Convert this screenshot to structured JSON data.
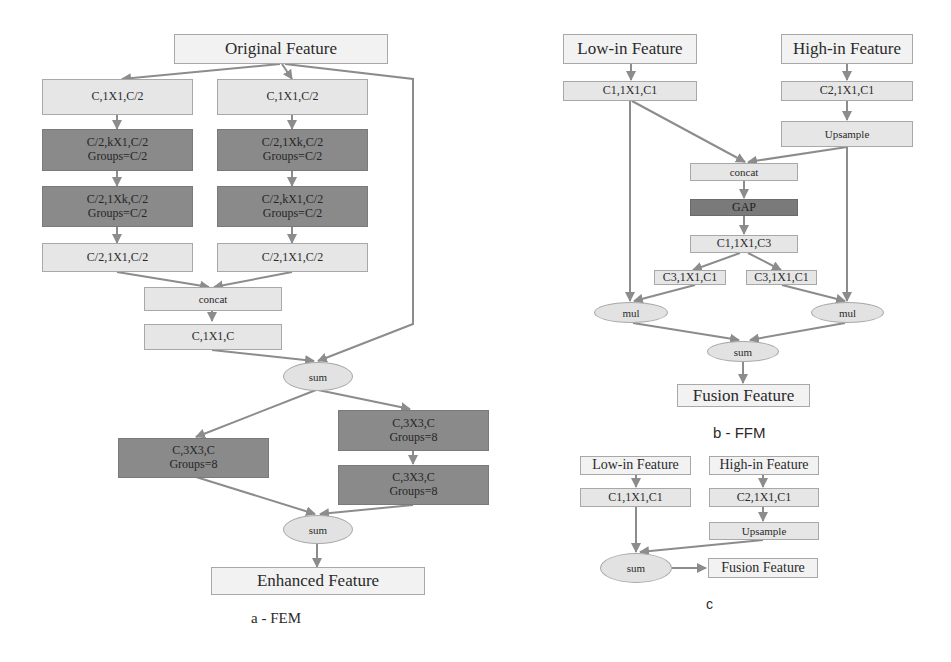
{
  "figure_a": {
    "caption": "a - FEM",
    "input": "Original Feature",
    "left_branch": [
      "C,1X1,C/2",
      "C/2,kX1,C/2",
      "Groups=C/2",
      "C/2,1Xk,C/2",
      "Groups=C/2",
      "C/2,1X1,C/2"
    ],
    "right_branch": [
      "C,1X1,C/2",
      "C/2,1Xk,C/2",
      "Groups=C/2",
      "C/2,kX1,C/2",
      "Groups=C/2",
      "C/2,1X1,C/2"
    ],
    "concat": "concat",
    "merge_conv": "C,1X1,C",
    "sum1": "sum",
    "left_dilated": [
      "C,3X3,C",
      "Groups=8"
    ],
    "right_dilated_1": [
      "C,3X3,C",
      "Groups=8"
    ],
    "right_dilated_2": [
      "C,3X3,C",
      "Groups=8"
    ],
    "sum2": "sum",
    "output": "Enhanced Feature"
  },
  "figure_b": {
    "caption": "b - FFM",
    "low_input": "Low-in Feature",
    "high_input": "High-in Feature",
    "low_conv": "C1,1X1,C1",
    "high_conv": "C2,1X1,C1",
    "upsample": "Upsample",
    "concat": "concat",
    "gap": "GAP",
    "squeeze": "C1,1X1,C3",
    "excite_left": "C3,1X1,C1",
    "excite_right": "C3,1X1,C1",
    "mul_left": "mul",
    "mul_right": "mul",
    "sum": "sum",
    "output": "Fusion Feature"
  },
  "figure_c": {
    "caption": "c",
    "low_input": "Low-in Feature",
    "high_input": "High-in Feature",
    "low_conv": "C1,1X1,C1",
    "high_conv": "C2,1X1,C1",
    "upsample": "Upsample",
    "sum": "sum",
    "output": "Fusion Feature"
  },
  "colors": {
    "light_block": "#e6e6e6",
    "dark_block": "#8a8a8a",
    "gap_block": "#7a7a7a",
    "arrow": "#8c8c8c"
  }
}
